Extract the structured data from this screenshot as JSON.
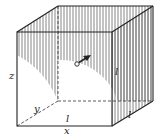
{
  "figure": {
    "labels": {
      "z": "z",
      "y": "y",
      "x": "x",
      "l_bottom": "l",
      "l_right_face": "l",
      "l_right_edge": "l"
    },
    "colors": {
      "line": "#222222",
      "hatch": "#555555",
      "background": "#ffffff"
    }
  }
}
